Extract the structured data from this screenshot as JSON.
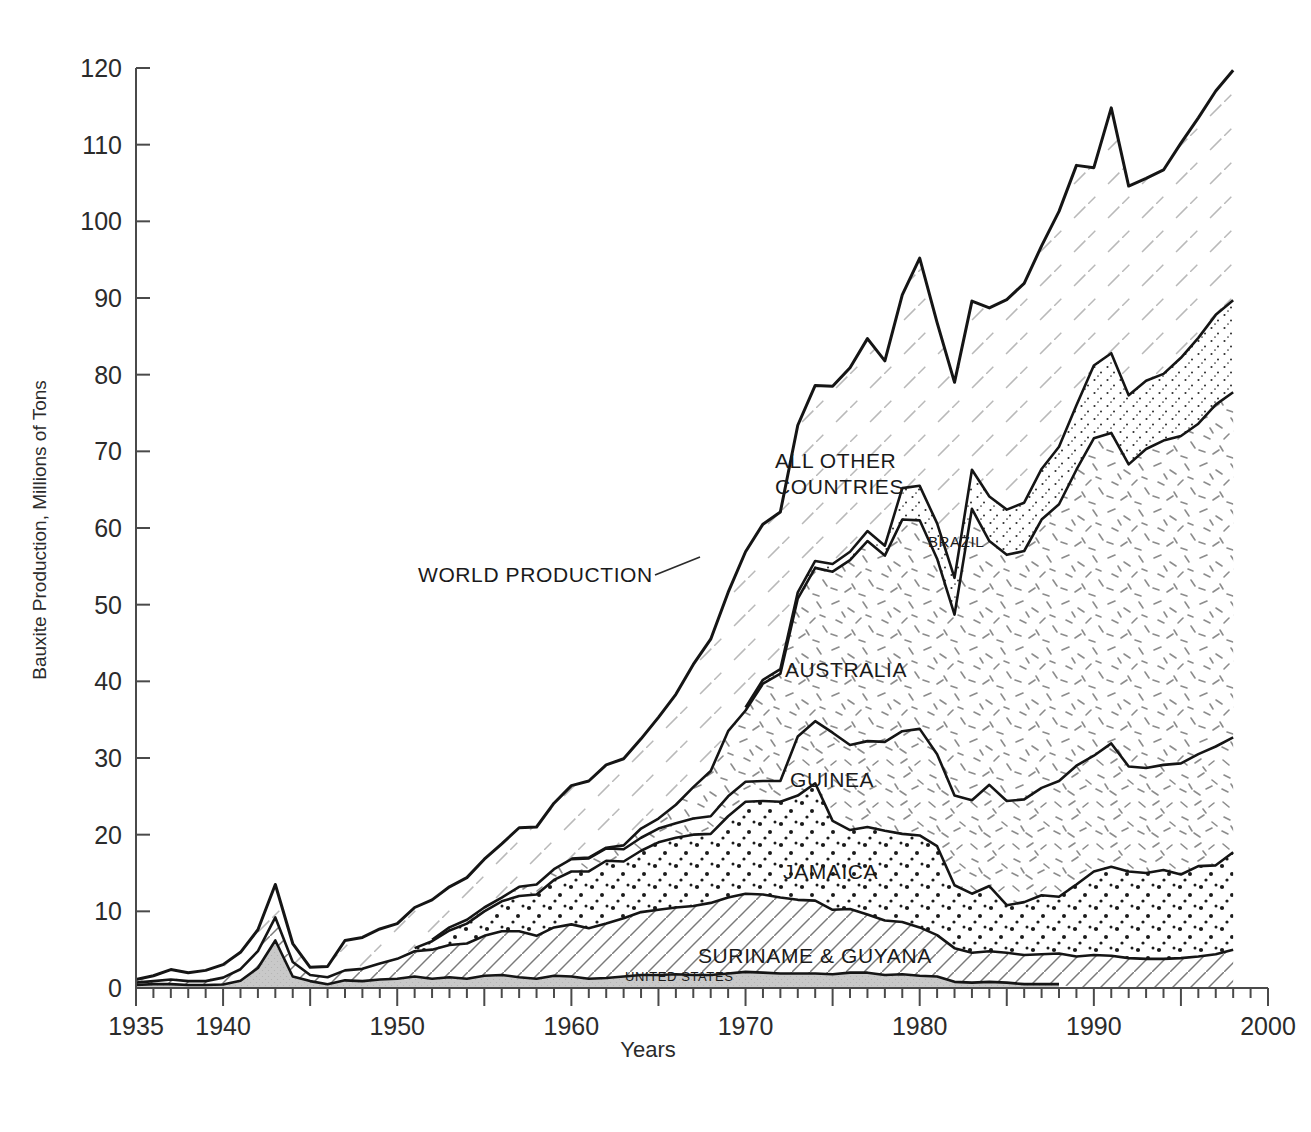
{
  "chart_data": {
    "type": "area",
    "stacked": true,
    "title": "",
    "xlabel": "Years",
    "ylabel": "Bauxite Production, Millions of Tons",
    "xlim": [
      1935,
      2000
    ],
    "ylim": [
      0,
      120
    ],
    "ytick_labels": [
      "0",
      "10",
      "20",
      "30",
      "40",
      "50",
      "60",
      "70",
      "80",
      "90",
      "100",
      "110",
      "120"
    ],
    "ytick_values": [
      0,
      10,
      20,
      30,
      40,
      50,
      60,
      70,
      80,
      90,
      100,
      110,
      120
    ],
    "xtick_labels": [
      "1935",
      "1940",
      "1950",
      "1960",
      "1970",
      "1980",
      "1990",
      "2000"
    ],
    "xtick_values": [
      1935,
      1940,
      1950,
      1960,
      1970,
      1980,
      1990,
      2000
    ],
    "minor_tick_interval": 1,
    "major_tick_interval": 5,
    "grid": false,
    "legend_position": "inline-annotations",
    "x": [
      1935,
      1936,
      1937,
      1938,
      1939,
      1940,
      1941,
      1942,
      1943,
      1944,
      1945,
      1946,
      1947,
      1948,
      1949,
      1950,
      1951,
      1952,
      1953,
      1954,
      1955,
      1956,
      1957,
      1958,
      1959,
      1960,
      1961,
      1962,
      1963,
      1964,
      1965,
      1966,
      1967,
      1968,
      1969,
      1970,
      1971,
      1972,
      1973,
      1974,
      1975,
      1976,
      1977,
      1978,
      1979,
      1980,
      1981,
      1982,
      1983,
      1984,
      1985,
      1986,
      1987,
      1988,
      1989,
      1990,
      1991,
      1992,
      1993,
      1994,
      1995,
      1996,
      1997,
      1998
    ],
    "series": [
      {
        "name": "UNITED STATES",
        "fill": "solid-gray",
        "color": "#c9c9c9",
        "values": [
          0.4,
          0.5,
          0.5,
          0.4,
          0.4,
          0.45,
          0.95,
          2.6,
          6.2,
          1.5,
          0.9,
          0.5,
          1.0,
          0.9,
          1.1,
          1.2,
          1.5,
          1.2,
          1.4,
          1.2,
          1.6,
          1.7,
          1.4,
          1.2,
          1.6,
          1.5,
          1.2,
          1.3,
          1.5,
          1.7,
          1.7,
          1.8,
          1.7,
          1.7,
          1.9,
          2.1,
          2.0,
          1.9,
          1.9,
          1.9,
          1.8,
          2.0,
          2.0,
          1.7,
          1.8,
          1.6,
          1.5,
          0.8,
          0.7,
          0.8,
          0.7,
          0.5,
          0.5,
          0.5,
          0,
          0,
          0,
          0,
          0,
          0,
          0,
          0,
          0,
          0
        ]
      },
      {
        "name": "SURINAME & GUYANA",
        "fill": "diagonal-hatch",
        "color": "#ffffff",
        "values": [
          0.3,
          0.4,
          0.6,
          0.5,
          0.5,
          0.9,
          1.5,
          2.2,
          3.0,
          1.9,
          0.8,
          0.9,
          1.3,
          1.6,
          2.1,
          2.6,
          3.3,
          3.8,
          4.2,
          4.6,
          5.2,
          5.7,
          6.0,
          5.6,
          6.3,
          6.8,
          6.6,
          7.1,
          7.6,
          8.2,
          8.5,
          8.7,
          9.0,
          9.4,
          9.9,
          10.2,
          10.2,
          9.9,
          9.6,
          9.5,
          8.4,
          8.3,
          7.6,
          7.1,
          6.8,
          6.3,
          5.4,
          4.4,
          3.9,
          4.0,
          3.9,
          3.8,
          3.9,
          4.0,
          4.1,
          4.3,
          4.2,
          3.9,
          3.8,
          3.8,
          3.9,
          4.1,
          4.4,
          5.0
        ]
      },
      {
        "name": "JAMAICA",
        "fill": "stipple-dots",
        "color": "#ffffff",
        "values": [
          0,
          0,
          0,
          0,
          0,
          0,
          0,
          0,
          0,
          0,
          0,
          0,
          0,
          0,
          0,
          0,
          0.4,
          1.1,
          1.9,
          2.6,
          3.2,
          3.9,
          4.6,
          5.4,
          6.2,
          6.9,
          7.4,
          8.2,
          7.4,
          8.0,
          8.8,
          9.1,
          9.3,
          9.0,
          10.6,
          12.0,
          12.2,
          12.5,
          13.6,
          15.3,
          11.6,
          10.3,
          11.4,
          11.7,
          11.5,
          12.0,
          11.6,
          8.2,
          7.7,
          8.5,
          6.2,
          6.9,
          7.7,
          7.4,
          9.4,
          10.9,
          11.6,
          11.3,
          11.2,
          11.6,
          10.9,
          11.8,
          11.6,
          12.7
        ]
      },
      {
        "name": "GUINEA",
        "fill": "dash-scatter-left",
        "color": "#ffffff",
        "values": [
          0,
          0,
          0,
          0,
          0,
          0,
          0,
          0,
          0,
          0,
          0,
          0,
          0,
          0,
          0,
          0,
          0,
          0.2,
          0.4,
          0.5,
          0.5,
          0.5,
          1.2,
          1.3,
          1.4,
          1.6,
          1.7,
          1.6,
          1.6,
          1.7,
          1.8,
          1.9,
          2.1,
          2.3,
          2.6,
          2.6,
          2.6,
          2.7,
          7.7,
          8.1,
          11.5,
          11.1,
          11.2,
          11.6,
          13.4,
          13.9,
          12.0,
          11.7,
          12.2,
          13.2,
          13.6,
          13.4,
          14.0,
          15.1,
          15.5,
          15.1,
          16.1,
          13.7,
          13.7,
          13.7,
          14.5,
          14.6,
          15.5,
          15.0
        ]
      },
      {
        "name": "AUSTRALIA",
        "fill": "dash-scatter-right",
        "color": "#ffffff",
        "values": [
          0,
          0,
          0,
          0,
          0,
          0,
          0,
          0,
          0,
          0,
          0,
          0,
          0,
          0,
          0,
          0,
          0,
          0,
          0,
          0,
          0,
          0,
          0,
          0,
          0,
          0.1,
          0.1,
          0.1,
          0.5,
          1.2,
          1.3,
          2.4,
          4.1,
          5.9,
          8.5,
          9.3,
          12.7,
          14.0,
          18.0,
          20.0,
          21.0,
          24.1,
          26.1,
          24.3,
          27.6,
          27.2,
          25.5,
          23.6,
          38.0,
          31.8,
          32.1,
          32.4,
          35.0,
          36.1,
          38.6,
          41.4,
          40.5,
          39.4,
          41.6,
          42.3,
          42.7,
          43.1,
          44.6,
          45.0
        ]
      },
      {
        "name": "BRAZIL",
        "fill": "fine-stipple",
        "color": "#ffffff",
        "values": [
          0,
          0,
          0,
          0,
          0,
          0,
          0,
          0,
          0,
          0,
          0,
          0,
          0,
          0,
          0,
          0,
          0,
          0,
          0,
          0,
          0,
          0,
          0,
          0,
          0,
          0,
          0,
          0,
          0,
          0,
          0,
          0,
          0,
          0,
          0,
          0.4,
          0.5,
          0.6,
          0.8,
          0.9,
          1.0,
          1.1,
          1.3,
          1.3,
          4.1,
          4.5,
          4.6,
          4.8,
          5.1,
          5.8,
          5.9,
          6.3,
          6.6,
          7.5,
          8.4,
          9.5,
          10.4,
          9.0,
          8.9,
          8.7,
          10.2,
          11.2,
          11.7,
          12.0
        ]
      },
      {
        "name": "ALL OTHER COUNTRIES",
        "fill": "wide-diagonal-hatch",
        "color": "#ffffff",
        "values": [
          0.4,
          0.7,
          1.3,
          1.1,
          1.4,
          1.7,
          2.2,
          2.8,
          4.3,
          2.4,
          1.0,
          1.4,
          3.9,
          4.1,
          4.5,
          4.6,
          5.3,
          5.2,
          5.3,
          5.5,
          6.3,
          7.0,
          7.7,
          7.5,
          8.6,
          9.5,
          10.0,
          10.8,
          11.3,
          11.7,
          13.2,
          14.4,
          16.0,
          17.2,
          18.1,
          20.3,
          20.3,
          20.5,
          21.8,
          22.9,
          23.2,
          24.0,
          25.1,
          24.1,
          25.2,
          29.7,
          26.2,
          25.5,
          22.0,
          24.6,
          27.4,
          28.6,
          29.1,
          30.7,
          31.3,
          25.8,
          32.0,
          27.3,
          26.4,
          26.6,
          28.0,
          28.7,
          29.2,
          30.0
        ]
      }
    ],
    "total_label": "WORLD PRODUCTION",
    "total_values": [
      1.1,
      1.6,
      2.4,
      2.0,
      2.3,
      3.05,
      4.65,
      7.6,
      13.5,
      5.8,
      2.7,
      2.8,
      6.2,
      6.6,
      7.7,
      8.4,
      10.5,
      11.5,
      13.2,
      14.4,
      16.8,
      18.8,
      20.9,
      21.0,
      24.1,
      26.4,
      26.9,
      29.1,
      29.9,
      32.5,
      35.3,
      38.3,
      42.2,
      45.5,
      51.6,
      56.9,
      58.5,
      62.1,
      73.4,
      78.6,
      78.5,
      80.9,
      84.7,
      81.8,
      90.4,
      95.2,
      86.8,
      79.0,
      89.6,
      88.7,
      89.8,
      91.9,
      96.8,
      101.3,
      107.3,
      107.0,
      114.8,
      104.6,
      105.6,
      106.7,
      110.2,
      113.5,
      117.0,
      119.7
    ]
  },
  "annotations": {
    "world_production": "WORLD PRODUCTION",
    "all_other_line1": "ALL OTHER",
    "all_other_line2": "COUNTRIES",
    "brazil": "BRAZIL",
    "australia": "AUSTRALIA",
    "guinea": "GUINEA",
    "jamaica": "JAMAICA",
    "suriname_guyana": "SURINAME & GUYANA",
    "united_states": "UNITED STATES"
  }
}
